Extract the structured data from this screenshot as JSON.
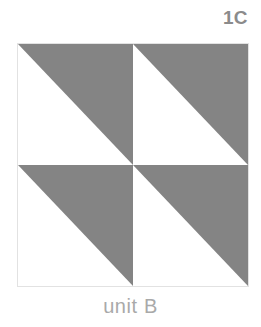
{
  "figure": {
    "plate_label": "1C",
    "caption": "unit B",
    "background_color": "#ffffff"
  },
  "colors": {
    "patch_gray": "#848484",
    "patch_white": "#ffffff",
    "block_outline": "#e2e2e2",
    "label_text": "#8b8b8b",
    "caption_text": "#a9a9a9"
  },
  "block": {
    "name": "unit B",
    "rows": 2,
    "columns": 2,
    "unit_type": "half-square-triangle",
    "units": [
      {
        "position": "top-left",
        "shaded_half": "upper-right",
        "diagonal": "bottom-left-to-top-right",
        "fill": "#848484"
      },
      {
        "position": "top-right",
        "shaded_half": "upper-right",
        "diagonal": "bottom-left-to-top-right",
        "fill": "#848484"
      },
      {
        "position": "bottom-left",
        "shaded_half": "upper-right",
        "diagonal": "bottom-left-to-top-right",
        "fill": "#848484"
      },
      {
        "position": "bottom-right",
        "shaded_half": "upper-right",
        "diagonal": "bottom-left-to-top-right",
        "fill": "#848484"
      }
    ]
  }
}
